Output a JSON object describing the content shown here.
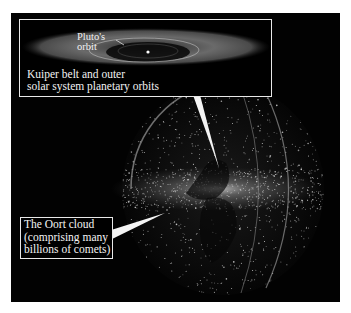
{
  "figure": {
    "colors": {
      "background": "#000000",
      "frame": "#e8e8e8",
      "text": "#f4f4f4",
      "particles": "#dcdcdc"
    }
  },
  "inset": {
    "pluto_label_line1": "Pluto's",
    "pluto_label_line2": "orbit",
    "kuiper_label_line1": "Kuiper belt and outer",
    "kuiper_label_line2": "solar system planetary orbits"
  },
  "oort_label": {
    "line1": "The Oort cloud",
    "line2": "(comprising many",
    "line3": "billions of comets)"
  }
}
